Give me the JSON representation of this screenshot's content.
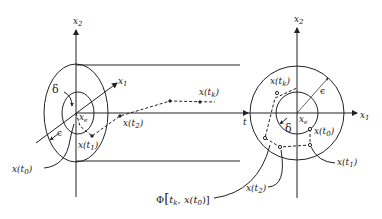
{
  "left_diagram": {
    "axis_x2": {
      "label": "x",
      "sub": "2"
    },
    "axis_x1": {
      "label": "x",
      "sub": "1"
    },
    "axis_t": {
      "label": "t"
    },
    "delta": "δ",
    "epsilon": "ϵ",
    "equilibrium": {
      "label": "x",
      "sub": "e"
    },
    "points": [
      {
        "label": "x(t",
        "sub": "0",
        "close": ")"
      },
      {
        "label": "x(t",
        "sub": "1",
        "close": ")"
      },
      {
        "label": "x(t",
        "sub": "2",
        "close": ")"
      },
      {
        "label": "x(t",
        "sub": "k",
        "close": ")"
      }
    ]
  },
  "right_diagram": {
    "axis_x2": {
      "label": "x",
      "sub": "2"
    },
    "axis_x1": {
      "label": "x",
      "sub": "1"
    },
    "delta": "δ",
    "epsilon": "ϵ",
    "equilibrium": {
      "label": "x",
      "sub": "e"
    },
    "points": [
      {
        "label": "x(t",
        "sub": "0",
        "close": ")"
      },
      {
        "label": "x(t",
        "sub": "1",
        "close": ")"
      },
      {
        "label": "x(t",
        "sub": "2",
        "close": ")"
      },
      {
        "label": "x(t",
        "sub": "k",
        "close": ")"
      }
    ]
  },
  "trajectory_label": {
    "phi": "Φ",
    "open": "[",
    "t": "t",
    "tsub": "k",
    "sep": ", x(t",
    "xsub": "0",
    "close": ")]"
  },
  "colors": {
    "ink": "#222222",
    "background": "#ffffff"
  }
}
